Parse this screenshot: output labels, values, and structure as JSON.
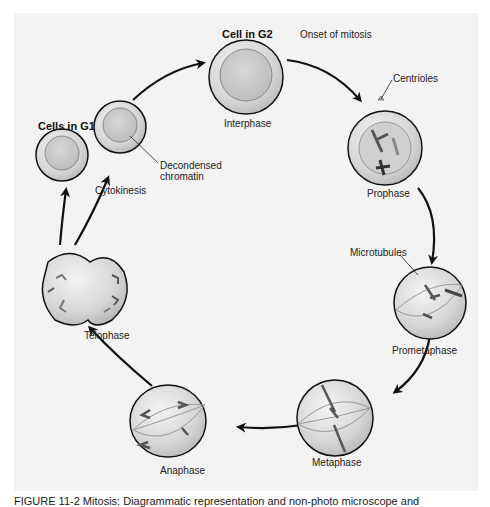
{
  "figure": {
    "stages": [
      {
        "id": "g1",
        "label": "Cells in G1"
      },
      {
        "id": "g2",
        "label": "Cell in G2"
      },
      {
        "id": "interphase",
        "label": "Interphase"
      },
      {
        "id": "prophase",
        "label": "Prophase"
      },
      {
        "id": "prometaphase",
        "label": "Prometaphase"
      },
      {
        "id": "metaphase",
        "label": "Metaphase"
      },
      {
        "id": "anaphase",
        "label": "Anaphase"
      },
      {
        "id": "telophase",
        "label": "Telophase"
      }
    ],
    "annotations": {
      "onset": "Onset of mitosis",
      "centrioles": "Centrioles",
      "microtubules": "Microtubules",
      "decondensed_1": "Decondensed",
      "decondensed_2": "chromatin",
      "cytokinesis": "Cytokinesis"
    },
    "caption": "FIGURE 11-2   Mitosis: Diagrammatic representation and non-photo microscope and"
  }
}
